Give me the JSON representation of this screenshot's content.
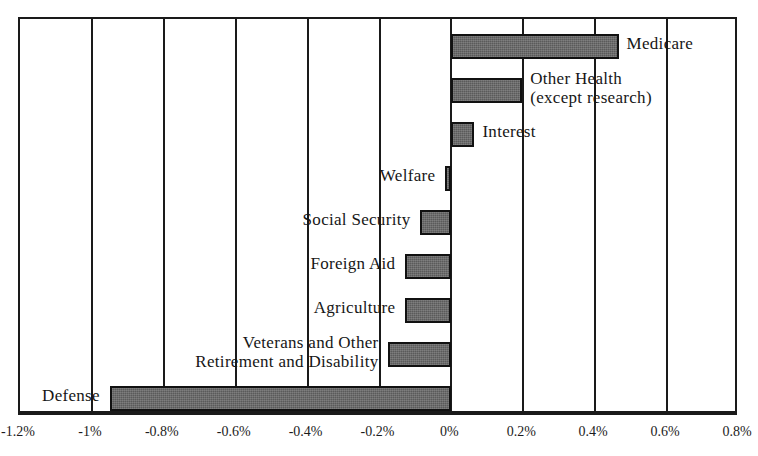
{
  "chart_data": {
    "type": "bar",
    "orientation": "horizontal",
    "title": "",
    "subtitle": "",
    "xlabel": "",
    "ylabel": "",
    "xlim": [
      -1.2,
      0.8
    ],
    "xticks": [
      -1.2,
      -1.0,
      -0.8,
      -0.6,
      -0.4,
      -0.2,
      0.0,
      0.2,
      0.4,
      0.6,
      0.8
    ],
    "xtick_labels": [
      "-1.2%",
      "-1%",
      "-0.8%",
      "-0.6%",
      "-0.4%",
      "-0.2%",
      "0%",
      "0.2%",
      "0.4%",
      "0.6%",
      "0.8%"
    ],
    "grid": true,
    "legend": false,
    "units": "percent",
    "categories": [
      "Medicare",
      "Other Health (except research)",
      "Interest",
      "Welfare",
      "Social Security",
      "Foreign Aid",
      "Agriculture",
      "Veterans and Other Retirement and Disability",
      "Defense"
    ],
    "values": [
      0.465,
      0.197,
      0.064,
      -0.017,
      -0.086,
      -0.128,
      -0.128,
      -0.175,
      -0.95
    ],
    "bar_fill_color": "#5a5a5a",
    "bar_edge_color": "#111111",
    "axis_color": "#1a1a1a",
    "background_color": "#ffffff"
  },
  "bars": [
    {
      "name": "medicare",
      "label_lines": [
        "Medicare"
      ],
      "value": 0.465,
      "label_side": "right",
      "label_align": "left"
    },
    {
      "name": "other-health",
      "label_lines": [
        "Other Health",
        "(except research)"
      ],
      "value": 0.197,
      "label_side": "right",
      "label_align": "left"
    },
    {
      "name": "interest",
      "label_lines": [
        "Interest"
      ],
      "value": 0.064,
      "label_side": "right",
      "label_align": "left"
    },
    {
      "name": "welfare",
      "label_lines": [
        "Welfare"
      ],
      "value": -0.017,
      "label_side": "left",
      "label_align": "right"
    },
    {
      "name": "social-security",
      "label_lines": [
        "Social Security"
      ],
      "value": -0.086,
      "label_side": "left",
      "label_align": "right"
    },
    {
      "name": "foreign-aid",
      "label_lines": [
        "Foreign Aid"
      ],
      "value": -0.128,
      "label_side": "left",
      "label_align": "right"
    },
    {
      "name": "agriculture",
      "label_lines": [
        "Agriculture"
      ],
      "value": -0.128,
      "label_side": "left",
      "label_align": "right"
    },
    {
      "name": "veterans-retirement-disability",
      "label_lines": [
        "Veterans and Other",
        "Retirement and Disability"
      ],
      "value": -0.175,
      "label_side": "left",
      "label_align": "right"
    },
    {
      "name": "defense",
      "label_lines": [
        "Defense"
      ],
      "value": -0.95,
      "label_side": "left",
      "label_align": "right"
    }
  ],
  "axis": {
    "tick_labels": [
      "-1.2%",
      "-1%",
      "-0.8%",
      "-0.6%",
      "-0.4%",
      "-0.2%",
      "0%",
      "0.2%",
      "0.4%",
      "0.6%",
      "0.8%"
    ]
  }
}
